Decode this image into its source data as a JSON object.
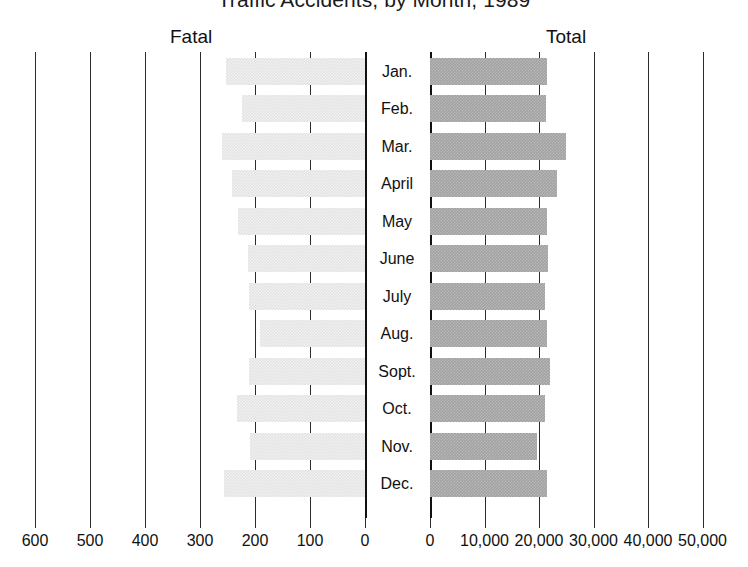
{
  "chart_data": {
    "type": "bar",
    "title": "Traffic Accidents, by Month, 1989",
    "orientation": "horizontal",
    "layout": "mirrored-dual-panel",
    "grid": true,
    "legend_position": "panel-headers",
    "categories": [
      "Jan.",
      "Feb.",
      "Mar.",
      "April",
      "May",
      "June",
      "July",
      "Aug.",
      "Sopt.",
      "Oct.",
      "Nov.",
      "Dec."
    ],
    "panels": [
      {
        "name": "fatal",
        "label": "Fatal",
        "direction": "right-to-left",
        "xlabel": "",
        "ylabel": "",
        "xlim": [
          0,
          600
        ],
        "ticks": [
          600,
          500,
          400,
          300,
          200,
          100,
          0
        ],
        "tick_labels": [
          "600",
          "500",
          "400",
          "300",
          "200",
          "100",
          "0"
        ],
        "color": "#e3e3e3",
        "values": [
          253,
          224,
          260,
          242,
          231,
          213,
          211,
          191,
          211,
          233,
          209,
          256
        ]
      },
      {
        "name": "total",
        "label": "Total",
        "direction": "left-to-right",
        "xlabel": "",
        "ylabel": "",
        "xlim": [
          0,
          50000
        ],
        "ticks": [
          0,
          10000,
          20000,
          30000,
          40000,
          50000
        ],
        "tick_labels": [
          "0",
          "10,000",
          "20,000",
          "30,000",
          "40,000",
          "50,000"
        ],
        "color": "#a2a2a2",
        "values": [
          21500,
          21300,
          25000,
          23300,
          21500,
          21700,
          21100,
          21500,
          22000,
          21100,
          19600,
          21500
        ]
      }
    ],
    "series": [
      {
        "name": "Fatal",
        "values": [
          253,
          224,
          260,
          242,
          231,
          213,
          211,
          191,
          211,
          233,
          209,
          256
        ]
      },
      {
        "name": "Total",
        "values": [
          21500,
          21300,
          25000,
          23300,
          21500,
          21700,
          21100,
          21500,
          22000,
          21100,
          19600,
          21500
        ]
      }
    ]
  }
}
